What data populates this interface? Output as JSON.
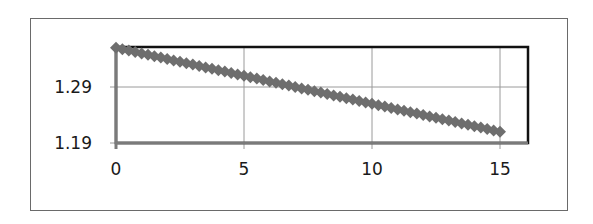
{
  "chart_data": {
    "type": "scatter",
    "title": "",
    "xlabel": "",
    "ylabel": "",
    "x_ticks": [
      0,
      5,
      10,
      15
    ],
    "x_tick_labels": [
      "0",
      "5",
      "10",
      "15"
    ],
    "y_ticks": [
      1.19,
      1.29
    ],
    "y_tick_labels": [
      "1.19",
      "1.29"
    ],
    "xlim": [
      0,
      16
    ],
    "ylim": [
      1.19,
      1.36
    ],
    "grid": true,
    "legend": null,
    "series": [
      {
        "name": "series-1",
        "marker": "diamond",
        "color": "#6e6e6e",
        "x_start": 0,
        "x_end": 15,
        "x_step": 0.25,
        "y_start": 1.36,
        "y_end": 1.21,
        "description": "Linear decreasing series from about 1.36 at x=0 to about 1.21 at x=15, densely sampled"
      }
    ]
  },
  "colors": {
    "marker": "#6e6e6e",
    "frame": "#6a6a6a",
    "plot_border": "#111111",
    "grid": "#9a9a9a",
    "axis": "#7a7a7a"
  }
}
